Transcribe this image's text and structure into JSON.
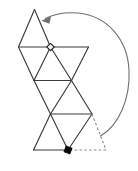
{
  "figure": {
    "title": "Triangular net with fold rotation",
    "background_color": "#ffffff",
    "canvas": {
      "width": 138,
      "height": 171
    }
  },
  "style": {
    "solid_edge_color": "#3b3b3b",
    "dashed_edge_color": "#8d8d8d",
    "arrow_color": "#6f6f6f",
    "open_marker_fill": "#ffffff",
    "open_marker_stroke": "#2a2a2a",
    "filled_marker_fill": "#0a0a0a",
    "stroke_width": 1.15
  },
  "net": {
    "name": "triangle-strip-net",
    "shape_type": "polyhedron-net",
    "triangle_count": 10,
    "solid_edges": [
      {
        "name": "top-apex-left-edge",
        "x1": 34.5,
        "y1": 9.5,
        "x2": 18.5,
        "y2": 47.0
      },
      {
        "name": "top-apex-right-edge",
        "x1": 34.5,
        "y1": 9.5,
        "x2": 50.5,
        "y2": 47.0
      },
      {
        "name": "upper-horizontal-rail",
        "x1": 18.5,
        "y1": 47.0,
        "x2": 88.5,
        "y2": 47.0
      },
      {
        "name": "left-down-to-mid",
        "x1": 18.5,
        "y1": 47.0,
        "x2": 34.0,
        "y2": 80.5
      },
      {
        "name": "mid-up-to-apex-right",
        "x1": 34.0,
        "y1": 80.5,
        "x2": 50.5,
        "y2": 47.0
      },
      {
        "name": "apex-right-down-to-mid-right",
        "x1": 50.5,
        "y1": 47.0,
        "x2": 71.5,
        "y2": 80.5
      },
      {
        "name": "upper-right-slant",
        "x1": 88.5,
        "y1": 47.0,
        "x2": 71.5,
        "y2": 80.5
      },
      {
        "name": "middle-horizontal-rail",
        "x1": 34.0,
        "y1": 80.5,
        "x2": 71.5,
        "y2": 80.5
      },
      {
        "name": "mid-left-down",
        "x1": 34.0,
        "y1": 80.5,
        "x2": 50.5,
        "y2": 114.0
      },
      {
        "name": "mid-right-down",
        "x1": 71.5,
        "y1": 80.5,
        "x2": 50.5,
        "y2": 114.0
      },
      {
        "name": "mid-right-down-outer",
        "x1": 71.5,
        "y1": 80.5,
        "x2": 92.0,
        "y2": 114.0
      },
      {
        "name": "lower-horizontal-rail",
        "x1": 50.5,
        "y1": 114.0,
        "x2": 92.0,
        "y2": 114.0
      },
      {
        "name": "lower-left-down",
        "x1": 50.5,
        "y1": 114.0,
        "x2": 33.5,
        "y2": 150.0
      },
      {
        "name": "lower-right-down",
        "x1": 92.0,
        "y1": 114.0,
        "x2": 68.0,
        "y2": 150.0
      },
      {
        "name": "lower-inner-down",
        "x1": 50.5,
        "y1": 114.0,
        "x2": 68.0,
        "y2": 150.0
      },
      {
        "name": "bottom-horizontal-rail",
        "x1": 33.5,
        "y1": 150.0,
        "x2": 68.0,
        "y2": 150.0
      }
    ],
    "dashed_edges": [
      {
        "name": "dashed-right-slant",
        "x1": 92.0,
        "y1": 114.0,
        "x2": 106.0,
        "y2": 150.0
      },
      {
        "name": "dashed-bottom-rail",
        "x1": 106.0,
        "y1": 150.0,
        "x2": 70.0,
        "y2": 150.0
      }
    ]
  },
  "markers": [
    {
      "name": "open-square-marker",
      "style": "open",
      "label": "start vertex",
      "cx": 50.5,
      "cy": 47.0,
      "size": 5.2,
      "rotation_deg": 45
    },
    {
      "name": "filled-square-marker",
      "style": "filled",
      "label": "end vertex",
      "cx": 68.0,
      "cy": 150.0,
      "size": 6.0,
      "rotation_deg": 20
    }
  ],
  "arrow": {
    "name": "fold-rotation-arrow",
    "label": "rotation sweep",
    "direction": "counterclockwise-to-upper-left",
    "path": "M 100.5 136.0 C 118.0 126.0 130.5 100.0 129.0 70.0 C 127.5 40.0 108.0 16.0 78.0 13.0 C 65.0 12.0 53.0 14.5 45.5 18.5",
    "head": {
      "name": "arrow-head-triangle",
      "points": "41.5,20.8 51.0,16.2 49.4,23.8",
      "tip_x": 41.5,
      "tip_y": 20.8
    }
  }
}
